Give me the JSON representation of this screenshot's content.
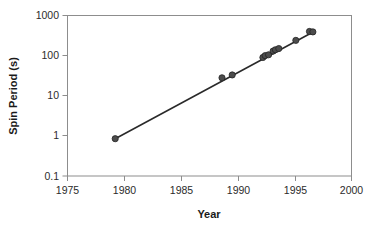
{
  "chart_data": {
    "type": "scatter",
    "title": "",
    "xlabel": "Year",
    "ylabel": "Spin Period (s)",
    "xlim": [
      1975,
      2000
    ],
    "ylim": [
      0.1,
      1000
    ],
    "yscale": "log",
    "xscale": "linear",
    "grid": false,
    "legend": null,
    "xticks": [
      "1975",
      "1980",
      "1985",
      "1990",
      "1995",
      "2000"
    ],
    "xtick_values": [
      1975,
      1980,
      1985,
      1990,
      1995,
      2000
    ],
    "yticks": [
      "0.1",
      "1",
      "10",
      "100",
      "1000"
    ],
    "ytick_values": [
      0.1,
      1,
      10,
      100,
      1000
    ],
    "series": [
      {
        "name": "Spin Period",
        "marker": "circle",
        "marker_color": "#4c4c4c",
        "points": [
          {
            "x": 1979.2,
            "y": 0.85
          },
          {
            "x": 1988.6,
            "y": 28
          },
          {
            "x": 1989.5,
            "y": 33
          },
          {
            "x": 1992.2,
            "y": 90
          },
          {
            "x": 1992.4,
            "y": 100
          },
          {
            "x": 1992.7,
            "y": 105
          },
          {
            "x": 1993.1,
            "y": 130
          },
          {
            "x": 1993.3,
            "y": 140
          },
          {
            "x": 1993.6,
            "y": 150
          },
          {
            "x": 1995.1,
            "y": 240
          },
          {
            "x": 1996.3,
            "y": 400
          },
          {
            "x": 1996.6,
            "y": 390
          }
        ]
      }
    ],
    "trendline": {
      "name": "fit-line",
      "color": "#2a2a2a",
      "x_start": 1979.2,
      "y_start": 0.85,
      "x_end": 1996.7,
      "y_end": 400
    }
  },
  "axes": {
    "x_title": "Year",
    "y_title": "Spin Period (s)"
  }
}
